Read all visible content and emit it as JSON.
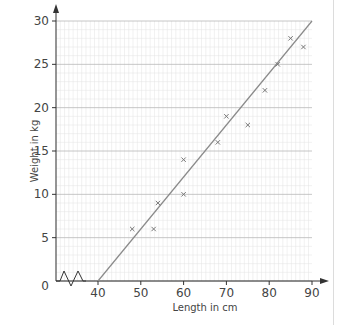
{
  "chart_data": {
    "type": "scatter",
    "title": "",
    "xlabel": "Length in cm",
    "ylabel": "Weight in kg",
    "xlim": [
      40,
      90
    ],
    "ylim": [
      0,
      30
    ],
    "x_axis_break": true,
    "origin_label": "0",
    "x_ticks": [
      40,
      50,
      60,
      70,
      80,
      90
    ],
    "y_ticks": [
      5,
      10,
      15,
      20,
      25,
      30
    ],
    "grid": true,
    "marker": "x",
    "points": [
      {
        "x": 48,
        "y": 6
      },
      {
        "x": 53,
        "y": 6
      },
      {
        "x": 54,
        "y": 9
      },
      {
        "x": 60,
        "y": 10
      },
      {
        "x": 60,
        "y": 14
      },
      {
        "x": 68,
        "y": 16
      },
      {
        "x": 70,
        "y": 19
      },
      {
        "x": 75,
        "y": 18
      },
      {
        "x": 79,
        "y": 22
      },
      {
        "x": 82,
        "y": 25
      },
      {
        "x": 85,
        "y": 28
      },
      {
        "x": 88,
        "y": 27
      }
    ],
    "line_of_best_fit": {
      "x1": 40,
      "y1": 0,
      "x2": 90,
      "y2": 30
    },
    "colors": {
      "grid_minor": "#e2e2e2",
      "grid_major": "#b8b8b8",
      "axis": "#333333",
      "points": "#777777",
      "line": "#8a8a8a"
    }
  }
}
